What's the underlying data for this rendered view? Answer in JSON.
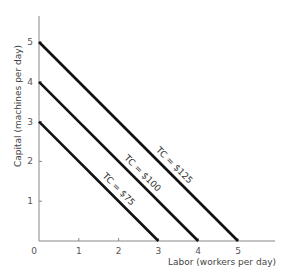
{
  "chart_data": {
    "type": "line",
    "title": "",
    "xlabel": "Labor (workers per day)",
    "ylabel": "Capital (machines per day)",
    "xlim": [
      0,
      6
    ],
    "ylim": [
      0,
      5.6
    ],
    "xticks": [
      "0",
      "1",
      "2",
      "3",
      "4",
      "5"
    ],
    "yticks": [
      "1",
      "2",
      "3",
      "4",
      "5"
    ],
    "grid": false,
    "legend": "none (inline labels on lines)",
    "series": [
      {
        "name": "TC = $75",
        "x": [
          0,
          3
        ],
        "y": [
          3,
          0
        ]
      },
      {
        "name": "TC = $100",
        "x": [
          0,
          4
        ],
        "y": [
          4,
          0
        ]
      },
      {
        "name": "TC = $125",
        "x": [
          0,
          5
        ],
        "y": [
          5,
          0
        ]
      }
    ]
  },
  "axes": {
    "origin_label": "0",
    "x_title": "Labor (workers per day)",
    "y_title": "Capital (machines per day)"
  },
  "labels": {
    "tc75": "TC = $75",
    "tc100": "TC = $100",
    "tc125": "TC = $125"
  },
  "colors": {
    "line": "#111111",
    "axis": "#888888",
    "text": "#555555"
  }
}
